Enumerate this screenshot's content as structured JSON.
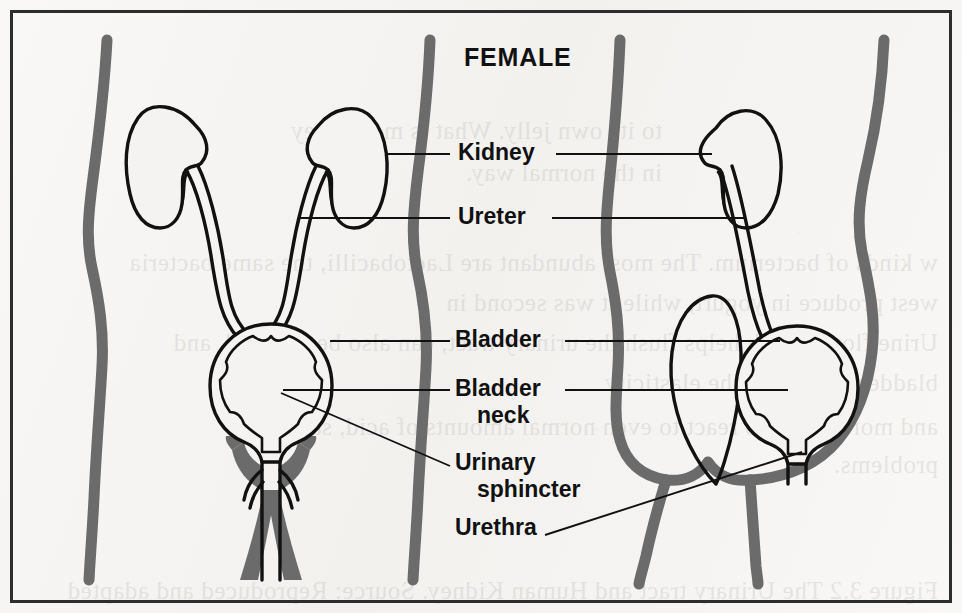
{
  "figure": {
    "title": "FEMALE",
    "alt_summary": "Line drawing of the female urinary tract shown in front view and side view with labelled parts",
    "views": [
      {
        "name": "front-view",
        "description": "anterior view of torso with both kidneys, ureters, bladder, bladder neck, urinary sphincter and urethra"
      },
      {
        "name": "side-view",
        "description": "lateral view of pelvis with kidney, ureter, uterus, bladder, bladder neck and urethra"
      }
    ]
  },
  "labels": [
    {
      "id": "kidney",
      "text": "Kidney",
      "line2": "",
      "x": 458,
      "y": 160,
      "leader_left": true,
      "leader_right": true
    },
    {
      "id": "ureter",
      "text": "Ureter",
      "line2": "",
      "x": 458,
      "y": 224,
      "leader_left": true,
      "leader_right": true
    },
    {
      "id": "bladder",
      "text": "Bladder",
      "line2": "",
      "x": 455,
      "y": 347,
      "leader_left": true,
      "leader_right": true
    },
    {
      "id": "bladder-neck",
      "text": "Bladder",
      "line2": "neck",
      "x": 455,
      "y": 396,
      "leader_left": true,
      "leader_right": true
    },
    {
      "id": "urinary-sphincter",
      "text": "Urinary",
      "line2": "sphincter",
      "x": 455,
      "y": 470,
      "leader_left": true,
      "leader_right": false
    },
    {
      "id": "urethra",
      "text": "Urethra",
      "line2": "",
      "x": 455,
      "y": 535,
      "leader_left": false,
      "leader_right": true
    }
  ],
  "colors": {
    "paper": "#f4f3f1",
    "ink": "#111111",
    "body_outline_gray": "#6b6b6b",
    "frame": "#2d2d2d",
    "organ_stroke": "#111111",
    "organ_fill": "none"
  },
  "bleed_text": [
    {
      "text": "to its own jelly. What is more, they",
      "x": 300,
      "y": 118
    },
    {
      "text": "in the normal way.",
      "x": 300,
      "y": 160
    },
    {
      "text": "w kinds of bacterium. The most abundant are Lactobacilli, the same bacteria",
      "x": 24,
      "y": 250
    },
    {
      "text": "west produce in yogurt, while it was second in",
      "x": 24,
      "y": 290
    },
    {
      "text": "Urine flow, which helps flush the urinary tract, can also be affected, and",
      "x": 24,
      "y": 330
    },
    {
      "text": "bladder walls lose the elasticity",
      "x": 24,
      "y": 370
    },
    {
      "text": "and more likely to react to even normal amounts of acid, saying",
      "x": 24,
      "y": 414
    },
    {
      "text": "problems.",
      "x": 24,
      "y": 452
    },
    {
      "text": "Figure 3.2 The Urinary tract and Human Kidney.  Source: Reproduced and adapted",
      "x": 24,
      "y": 578
    }
  ]
}
